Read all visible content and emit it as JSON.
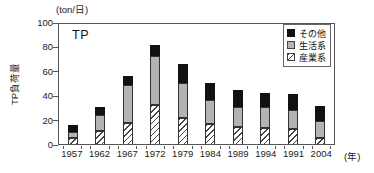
{
  "chart_data": {
    "type": "bar",
    "stacked": true,
    "title": "TP",
    "unit_label": "(ton/日)",
    "ylabel": "TP負荷量",
    "xlabel_suffix": "(年)",
    "categories": [
      "1957",
      "1962",
      "1967",
      "1972",
      "1979",
      "1984",
      "1989",
      "1994",
      "1991",
      "2004"
    ],
    "series": [
      {
        "name": "産業系",
        "style": "hatched",
        "values": [
          5,
          11,
          17,
          32,
          21,
          16,
          14,
          13,
          12,
          5
        ]
      },
      {
        "name": "生活系",
        "style": "gray",
        "values": [
          5,
          13,
          31,
          40,
          29,
          20,
          16,
          17,
          16,
          14
        ]
      },
      {
        "name": "その他",
        "style": "black",
        "values": [
          6,
          6,
          8,
          9,
          16,
          14,
          14,
          12,
          13,
          12
        ]
      }
    ],
    "totals": [
      16,
      30,
      56,
      81,
      66,
      50,
      44,
      42,
      41,
      31
    ],
    "ylim": [
      0,
      100
    ],
    "yticks": [
      0,
      20,
      40,
      60,
      80,
      100
    ],
    "legend_position": "top-right",
    "legend_order": [
      "その他",
      "生活系",
      "産業系"
    ],
    "grid": false
  },
  "colors": {
    "black_series": "#111111",
    "gray_series": "#b3b3b3",
    "hatch_line": "#444444",
    "axis": "#555555",
    "text": "#111111",
    "background": "#ffffff"
  }
}
